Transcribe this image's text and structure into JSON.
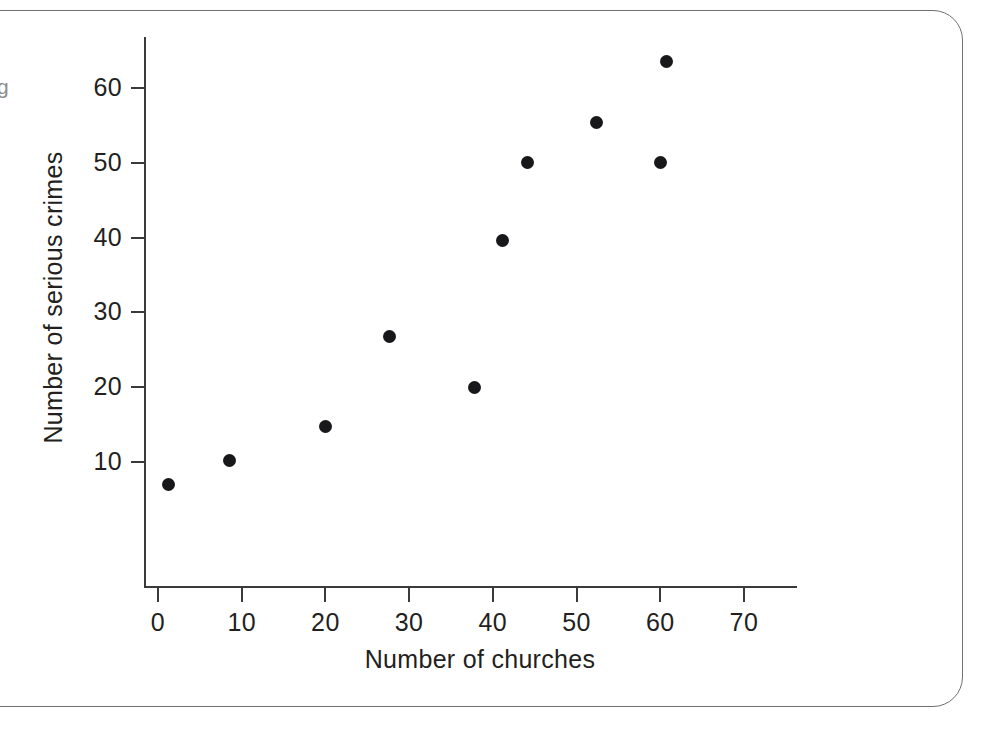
{
  "frame": {
    "border_color": "#6e7072",
    "margin_glyph": "g"
  },
  "chart_data": {
    "type": "scatter",
    "title": "",
    "xlabel": "Number of churches",
    "ylabel": "Number of serious crimes",
    "xlim": [
      0,
      76
    ],
    "ylim": [
      0,
      67
    ],
    "grid": false,
    "legend": null,
    "marker_color": "#18181a",
    "axis_color": "#3a3a3c",
    "xticks": [
      0,
      10,
      20,
      30,
      40,
      50,
      60,
      70
    ],
    "xtick_labels": [
      "0",
      "10",
      "20",
      "30",
      "40",
      "50",
      "60",
      "70"
    ],
    "yticks": [
      10,
      20,
      30,
      40,
      50,
      60
    ],
    "ytick_labels": [
      "10",
      "20",
      "30",
      "40",
      "50",
      "60"
    ],
    "x": [
      1.3,
      8.6,
      20.0,
      27.6,
      37.8,
      41.2,
      44.2,
      52.4,
      60.0,
      60.8
    ],
    "y": [
      7.0,
      10.2,
      14.8,
      26.8,
      20.0,
      39.6,
      50.1,
      55.4,
      50.0,
      63.6
    ],
    "points": [
      {
        "x": 1.3,
        "y": 7.0
      },
      {
        "x": 8.6,
        "y": 10.2
      },
      {
        "x": 20.0,
        "y": 14.8
      },
      {
        "x": 27.6,
        "y": 26.8
      },
      {
        "x": 37.8,
        "y": 20.0
      },
      {
        "x": 41.2,
        "y": 39.6
      },
      {
        "x": 44.2,
        "y": 50.1
      },
      {
        "x": 52.4,
        "y": 55.4
      },
      {
        "x": 60.0,
        "y": 50.0
      },
      {
        "x": 60.8,
        "y": 63.6
      }
    ]
  }
}
